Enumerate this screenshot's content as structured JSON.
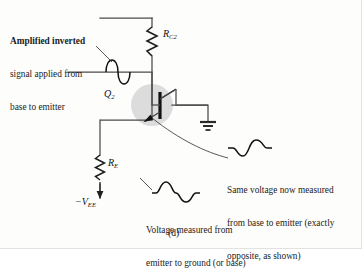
{
  "figure": {
    "label": "(d)",
    "type": "transistor-amplifier-schematic"
  },
  "annotations": {
    "top_left": {
      "line1": "Amplified inverted",
      "line2": "signal applied from",
      "line3": "base to emitter"
    },
    "right": {
      "line1": "Same voltage now measured",
      "line2": "from base to emitter (exactly",
      "line3": "opposite, as shown)"
    },
    "bottom": {
      "line1": "Voltage measured from",
      "line2": "emitter to ground (or base)"
    }
  },
  "components": {
    "collector_resistor": {
      "name": "R",
      "sub": "C2",
      "display": "R"
    },
    "emitter_resistor": {
      "name": "R",
      "sub": "E",
      "display": "R"
    },
    "transistor": {
      "name": "Q",
      "sub": "2",
      "display": "Q"
    },
    "supply": {
      "prefix": "−",
      "name": "V",
      "sub": "EE",
      "display": "−V"
    },
    "ground": {
      "icon": "ground-symbol"
    }
  },
  "waveforms": {
    "base_input": {
      "orientation": "vertical",
      "phase": "positive-first",
      "icon": "sine-wave"
    },
    "emitter_to_ground": {
      "orientation": "horizontal",
      "phase": "positive-first",
      "icon": "sine-wave"
    },
    "base_to_emitter": {
      "orientation": "horizontal",
      "phase": "negative-first",
      "icon": "sine-wave"
    }
  },
  "colors": {
    "ink": "#1a1a1a",
    "wire": "#444444",
    "highlight": "#d8d8d8",
    "background": "#fdfdfc"
  }
}
